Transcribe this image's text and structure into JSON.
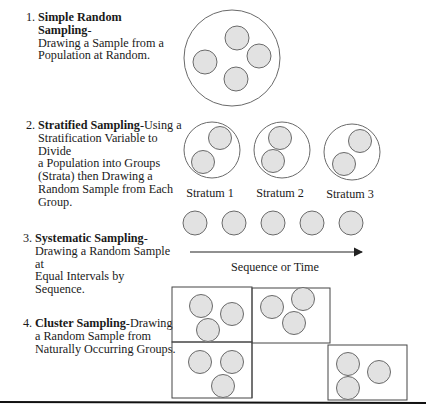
{
  "items": [
    {
      "number": "1.",
      "title": "Simple Random Sampling",
      "suffix": "-",
      "description_lines": [
        "Drawing a Sample from a",
        "Population at Random."
      ]
    },
    {
      "number": "2.",
      "title": "Stratified Sampling",
      "suffix": "-Using a",
      "description_lines": [
        "Stratification Variable to Divide",
        "a Population into Groups",
        "(Strata) then Drawing a",
        "Random Sample from Each",
        "Group."
      ]
    },
    {
      "number": "3.",
      "title": "Systematic Sampling",
      "suffix": "-",
      "description_lines": [
        "Drawing a Random Sample at",
        "Equal Intervals by Sequence."
      ]
    },
    {
      "number": "4.",
      "title": "Cluster Sampling",
      "suffix": "-Drawing",
      "description_lines": [
        "a Random Sample from",
        "Naturally Occurring Groups."
      ]
    }
  ],
  "diagram": {
    "strata_labels": [
      "Stratum 1",
      "Stratum 2",
      "Stratum 3"
    ],
    "systematic_axis_label": "Sequence or Time"
  },
  "colors": {
    "sample_fill": "#e2e2e2",
    "stroke": "#6a6a6a",
    "line": "#222222"
  }
}
